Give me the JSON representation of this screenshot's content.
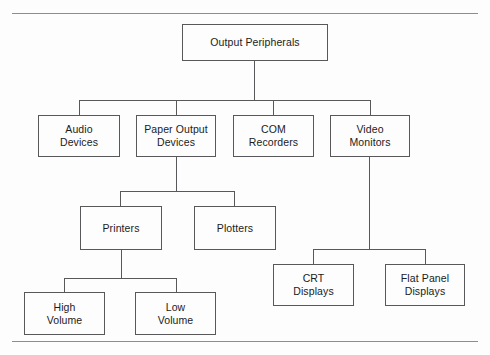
{
  "diagram": {
    "type": "tree",
    "line_color": "#58585a",
    "rule_color": "#8d8d8d",
    "background": "#fdfdfd",
    "text_color": "#1b1b1b",
    "nodes": [
      {
        "id": "output-peripherals",
        "label": "Output Peripherals",
        "level": 0,
        "x": 182,
        "y": 24,
        "w": 146,
        "h": 37
      },
      {
        "id": "audio-devices",
        "label": "Audio\nDevices",
        "line1": "Audio",
        "line2": "Devices",
        "level": 1,
        "x": 38,
        "y": 115,
        "w": 82,
        "h": 42
      },
      {
        "id": "paper-output-devices",
        "label": "Paper Output\nDevices",
        "line1": "Paper Output",
        "line2": "Devices",
        "level": 1,
        "x": 136,
        "y": 115,
        "w": 80,
        "h": 42
      },
      {
        "id": "com-recorders",
        "label": "COM\nRecorders",
        "line1": "COM",
        "line2": "Recorders",
        "level": 1,
        "x": 233,
        "y": 115,
        "w": 81,
        "h": 42
      },
      {
        "id": "video-monitors",
        "label": "Video\nMonitors",
        "line1": "Video",
        "line2": "Monitors",
        "level": 1,
        "x": 330,
        "y": 115,
        "w": 80,
        "h": 42
      },
      {
        "id": "printers",
        "label": "Printers",
        "line1": "Printers",
        "line2": "",
        "level": 2,
        "x": 80,
        "y": 206,
        "w": 82,
        "h": 44
      },
      {
        "id": "plotters",
        "label": "Plotters",
        "line1": "Plotters",
        "line2": "",
        "level": 2,
        "x": 194,
        "y": 206,
        "w": 82,
        "h": 44
      },
      {
        "id": "crt-displays",
        "label": "CRT\nDisplays",
        "line1": "CRT",
        "line2": "Displays",
        "level": 2,
        "x": 273,
        "y": 264,
        "w": 81,
        "h": 42
      },
      {
        "id": "flat-panel-displays",
        "label": "Flat Panel\nDisplays",
        "line1": "Flat Panel",
        "line2": "Displays",
        "level": 2,
        "x": 385,
        "y": 264,
        "w": 80,
        "h": 42
      },
      {
        "id": "high-volume",
        "label": "High\nVolume",
        "line1": "High",
        "line2": "Volume",
        "level": 3,
        "x": 24,
        "y": 292,
        "w": 81,
        "h": 43
      },
      {
        "id": "low-volume",
        "label": "Low\nVolume",
        "line1": "Low",
        "line2": "Volume",
        "level": 3,
        "x": 135,
        "y": 292,
        "w": 81,
        "h": 43
      }
    ],
    "edges": [
      {
        "from": "output-peripherals",
        "to": "audio-devices"
      },
      {
        "from": "output-peripherals",
        "to": "paper-output-devices"
      },
      {
        "from": "output-peripherals",
        "to": "com-recorders"
      },
      {
        "from": "output-peripherals",
        "to": "video-monitors"
      },
      {
        "from": "paper-output-devices",
        "to": "printers"
      },
      {
        "from": "paper-output-devices",
        "to": "plotters"
      },
      {
        "from": "video-monitors",
        "to": "crt-displays"
      },
      {
        "from": "video-monitors",
        "to": "flat-panel-displays"
      },
      {
        "from": "printers",
        "to": "high-volume"
      },
      {
        "from": "printers",
        "to": "low-volume"
      }
    ]
  }
}
